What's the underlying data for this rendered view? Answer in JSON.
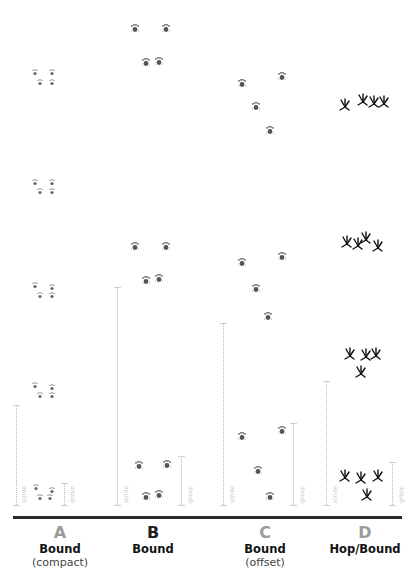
{
  "columns": [
    {
      "letter": "A",
      "letter_color": "#9a9a9a",
      "gait": "Bound",
      "note": "(compact)"
    },
    {
      "letter": "B",
      "letter_color": "#222222",
      "gait": "Bound",
      "note": ""
    },
    {
      "letter": "C",
      "letter_color": "#9a9a9a",
      "gait": "Bound",
      "note": "(offset)"
    },
    {
      "letter": "D",
      "letter_color": "#9a9a9a",
      "gait": "Hop/Bound",
      "note": ""
    }
  ],
  "measure_labels": {
    "stride": "stride",
    "group": "group"
  },
  "colors": {
    "rule": "#2a2a2a",
    "track": "#555555",
    "bird_track": "#111111",
    "measure_line": "#b8b8b8"
  }
}
